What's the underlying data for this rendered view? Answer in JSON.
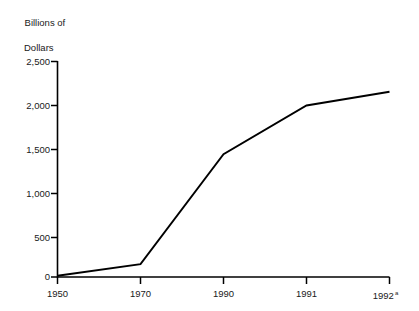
{
  "chart_data": {
    "type": "line",
    "title": "Billions of Dollars",
    "title_line1": "Billions of",
    "title_line2": "Dollars",
    "xlabel": "",
    "ylabel": "Billions of Dollars",
    "categories": [
      "1950",
      "1970",
      "1990",
      "1991",
      "1992"
    ],
    "x": [
      "1950",
      "1970",
      "1990",
      "1991",
      "1992"
    ],
    "values": [
      15,
      150,
      1425,
      1990,
      2150
    ],
    "series": [
      {
        "name": "Billions of Dollars",
        "values": [
          15,
          150,
          1425,
          1990,
          2150
        ]
      }
    ],
    "ylim": [
      0,
      2500
    ],
    "yticks": [
      0,
      500,
      1000,
      1500,
      2000,
      2500
    ],
    "ytick_labels": [
      "0",
      "500",
      "1,000",
      "1,500",
      "2,000",
      "2,500"
    ],
    "xtick_labels": [
      "1950",
      "1970",
      "1990",
      "1991",
      "1992"
    ],
    "footnote_marker": "a",
    "footnote_on_category": "1992",
    "grid": false,
    "legend": null,
    "line_color": "#000000",
    "background_color": "#ffffff",
    "axis_color": "#000000"
  },
  "axis": {
    "y_title_line1": "Billions of",
    "y_title_line2": "Dollars",
    "y_labels": [
      "2,500",
      "2,000",
      "1,500",
      "1,000",
      "500",
      "0"
    ],
    "x_labels": [
      "1950",
      "1970",
      "1990",
      "1991",
      "1992"
    ],
    "x_last_superscript": "a"
  }
}
